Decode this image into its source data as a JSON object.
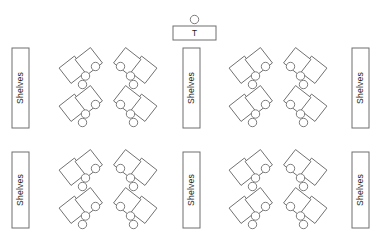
{
  "diagram": {
    "canvas": {
      "width": 390,
      "height": 235,
      "background": "#ffffff"
    },
    "stroke_color": "#6e6e6e",
    "text_color": "#1a1a1a",
    "fill_color": "#ffffff"
  },
  "teacher_station": {
    "desk_label": "T",
    "desk": {
      "x": 173,
      "y": 26,
      "width": 43,
      "height": 14
    },
    "chair": {
      "cx": 194.5,
      "cy": 19.5,
      "r": 4.2
    }
  },
  "shelves": {
    "label": "Shelves",
    "rotation_deg": -90,
    "units": [
      {
        "id": "shelf-left-top",
        "x": 12,
        "y": 48,
        "width": 17,
        "height": 80
      },
      {
        "id": "shelf-middle-top",
        "x": 183,
        "y": 48,
        "width": 17,
        "height": 80
      },
      {
        "id": "shelf-right-top",
        "x": 352,
        "y": 48,
        "width": 17,
        "height": 80
      },
      {
        "id": "shelf-left-bottom",
        "x": 12,
        "y": 152,
        "width": 17,
        "height": 76
      },
      {
        "id": "shelf-middle-bottom",
        "x": 183,
        "y": 152,
        "width": 17,
        "height": 76
      },
      {
        "id": "shelf-right-bottom",
        "x": 352,
        "y": 152,
        "width": 17,
        "height": 76
      }
    ]
  },
  "desk_geometry": {
    "desk_size": 19.5,
    "desk_rotation_deg": -38,
    "chair_radius": 4.2,
    "cluster_vertical_gap": 38,
    "note": "Each cluster = 2 stacked desk-pair units; each unit = 2 rotated squares plus 3 chairs"
  },
  "desk_clusters": [
    {
      "id": "cluster-r1-c1",
      "row": 1,
      "col": 1,
      "ox": 63,
      "oy": 50,
      "mirrored": false
    },
    {
      "id": "cluster-r1-c2",
      "row": 1,
      "col": 2,
      "ox": 117,
      "oy": 50,
      "mirrored": true
    },
    {
      "id": "cluster-r1-c3",
      "row": 1,
      "col": 3,
      "ox": 233,
      "oy": 50,
      "mirrored": false
    },
    {
      "id": "cluster-r1-c4",
      "row": 1,
      "col": 4,
      "ox": 287,
      "oy": 50,
      "mirrored": true
    },
    {
      "id": "cluster-r2-c1",
      "row": 2,
      "col": 1,
      "ox": 63,
      "oy": 152,
      "mirrored": false
    },
    {
      "id": "cluster-r2-c2",
      "row": 2,
      "col": 2,
      "ox": 117,
      "oy": 152,
      "mirrored": true
    },
    {
      "id": "cluster-r2-c3",
      "row": 2,
      "col": 3,
      "ox": 233,
      "oy": 152,
      "mirrored": false
    },
    {
      "id": "cluster-r2-c4",
      "row": 2,
      "col": 4,
      "ox": 287,
      "oy": 152,
      "mirrored": true
    }
  ],
  "counts": {
    "shelf_units": 6,
    "desk_clusters": 8,
    "teacher_desks": 1
  }
}
